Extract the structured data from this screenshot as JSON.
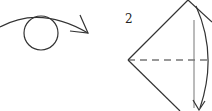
{
  "diagram": {
    "type": "origami-instruction",
    "step_number": "2",
    "elements": [
      {
        "name": "flip-over-arrow",
        "description": "curved arrow over circle indicating turn over"
      },
      {
        "name": "kite-fold",
        "description": "diamond shape with dashed horizontal center line and curved fold arrow"
      }
    ],
    "colors": {
      "line": "#333333",
      "background": "#ffffff"
    }
  }
}
